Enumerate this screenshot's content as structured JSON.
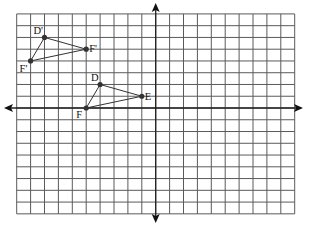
{
  "figure": {
    "grid": {
      "x_min": -10,
      "x_max": 10,
      "y_min": -9,
      "y_max": 8,
      "cols": 20,
      "rows": 17,
      "origin_px": [
        155.7,
        108
      ],
      "cell_w": 13.9,
      "cell_h": 11.76,
      "left_px": 16.7,
      "top_px": 14,
      "right_px": 294.7,
      "bottom_px": 213.9
    },
    "axes": {
      "x_arrow_left_tip": [
        4,
        108
      ],
      "x_arrow_right_tip": [
        303,
        108
      ],
      "y_arrow_top_tip": [
        155.7,
        3
      ],
      "y_arrow_bottom_tip": [
        155.7,
        223
      ]
    },
    "triangles": [
      {
        "name": "original",
        "vertices": [
          {
            "label": "D",
            "x": -4,
            "y": 2,
            "label_dx": -9,
            "label_dy": -3
          },
          {
            "label": "E",
            "x": -1,
            "y": 1,
            "label_dx": 3,
            "label_dy": 4
          },
          {
            "label": "F",
            "x": -5,
            "y": 0,
            "label_dx": -10,
            "label_dy": 10
          }
        ]
      },
      {
        "name": "image",
        "vertices": [
          {
            "label": "D'",
            "x": -8,
            "y": 6,
            "label_dx": -11,
            "label_dy": -3
          },
          {
            "label": "F'",
            "x": -5,
            "y": 5,
            "label_dx": 3,
            "label_dy": 3
          },
          {
            "label": "F'",
            "x": -9,
            "y": 4,
            "label_dx": -11,
            "label_dy": 11
          }
        ]
      }
    ],
    "colors": {
      "grid": "#5a5a5a",
      "axis": "#222222",
      "point": "#333333",
      "background": "#ffffff"
    }
  }
}
